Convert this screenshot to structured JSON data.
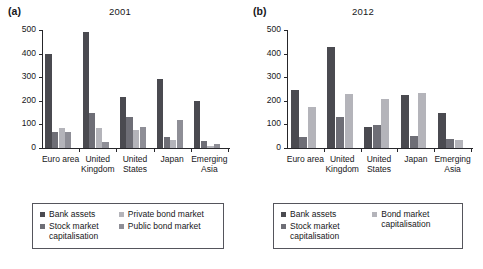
{
  "figure": {
    "panels": [
      {
        "label": "(a)",
        "title": "2001"
      },
      {
        "label": "(b)",
        "title": "2012"
      }
    ]
  },
  "chart_data": [
    {
      "type": "bar",
      "title": "2001",
      "panel_label": "(a)",
      "xlabel": "",
      "ylabel": "",
      "ylim": [
        0,
        500
      ],
      "yticks": [
        0,
        100,
        200,
        300,
        400,
        500
      ],
      "ytick_labels": [
        "0",
        "100",
        "200",
        "300",
        "400",
        "500"
      ],
      "grid": false,
      "legend_position": "below-plot",
      "categories": [
        "Euro area",
        "United Kingdom",
        "United States",
        "Japan",
        "Emerging Asia"
      ],
      "series": [
        {
          "name": "Bank assets",
          "color": "#4a4a50",
          "values": [
            399,
            491,
            216,
            292,
            198
          ]
        },
        {
          "name": "Stock market capitalisation",
          "color": "#6e6e76",
          "values": [
            68,
            150,
            130,
            48,
            28
          ]
        },
        {
          "name": "Private bond market",
          "color": "#b4b4ba",
          "values": [
            83,
            86,
            78,
            32,
            9
          ]
        },
        {
          "name": "Public bond market",
          "color": "#8e8e96",
          "values": [
            67,
            25,
            88,
            118,
            18
          ]
        }
      ]
    },
    {
      "type": "bar",
      "title": "2012",
      "panel_label": "(b)",
      "xlabel": "",
      "ylabel": "",
      "ylim": [
        0,
        500
      ],
      "yticks": [
        0,
        100,
        200,
        300,
        400,
        500
      ],
      "ytick_labels": [
        "0",
        "100",
        "200",
        "300",
        "400",
        "500"
      ],
      "grid": false,
      "legend_position": "below-plot",
      "categories": [
        "Euro area",
        "United Kingdom",
        "United States",
        "Japan",
        "Emerging Asia"
      ],
      "series": [
        {
          "name": "Bank assets",
          "color": "#4a4a50",
          "values": [
            247,
            428,
            87,
            225,
            148
          ]
        },
        {
          "name": "Stock market capitalisation",
          "color": "#6e6e76",
          "values": [
            45,
            133,
            96,
            50,
            37
          ]
        },
        {
          "name": "Bond market capitalisation",
          "color": "#b4b4ba",
          "values": [
            175,
            228,
            207,
            233,
            36
          ]
        }
      ]
    }
  ],
  "legends": [
    {
      "left_items": [
        {
          "label": "Bank assets",
          "color": "#4a4a50"
        },
        {
          "label": "Stock market\ncapitalisation",
          "color": "#6e6e76"
        }
      ],
      "right_items": [
        {
          "label": "Private bond market",
          "color": "#b4b4ba"
        },
        {
          "label": "Public bond market",
          "color": "#8e8e96"
        }
      ]
    },
    {
      "left_items": [
        {
          "label": "Bank assets",
          "color": "#4a4a50"
        },
        {
          "label": "Stock market\ncapitalisation",
          "color": "#6e6e76"
        }
      ],
      "right_items": [
        {
          "label": "Bond market\ncapitalisation",
          "color": "#b4b4ba"
        }
      ]
    }
  ]
}
